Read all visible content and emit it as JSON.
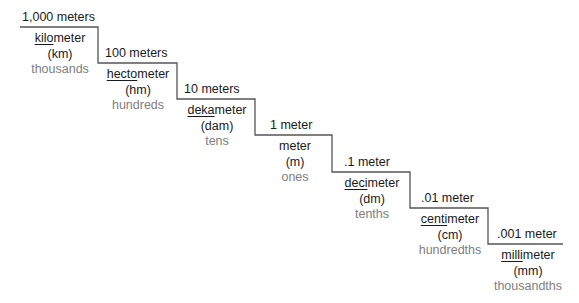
{
  "steps": [
    {
      "amount": "1,000 meters",
      "prefix": "kilo",
      "base": "meter",
      "abbr": "(km)",
      "place": "thousands"
    },
    {
      "amount": "100 meters",
      "prefix": "hecto",
      "base": "meter",
      "abbr": "(hm)",
      "place": "hundreds"
    },
    {
      "amount": "10 meters",
      "prefix": "deka",
      "base": "meter",
      "abbr": "(dam)",
      "place": "tens"
    },
    {
      "amount": "1 meter",
      "prefix": "",
      "base": "meter",
      "abbr": "(m)",
      "place": "ones"
    },
    {
      "amount": ".1 meter",
      "prefix": "deci",
      "base": "meter",
      "abbr": "(dm)",
      "place": "tenths"
    },
    {
      "amount": ".01 meter",
      "prefix": "centi",
      "base": "meter",
      "abbr": "(cm)",
      "place": "hundredths"
    },
    {
      "amount": ".001 meter",
      "prefix": "milli",
      "base": "meter",
      "abbr": "(mm)",
      "place": "thousandths"
    }
  ]
}
